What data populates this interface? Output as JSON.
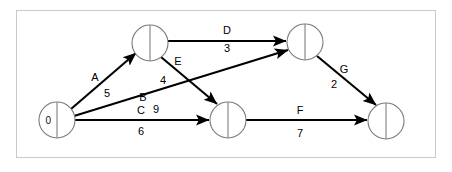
{
  "figure": {
    "type": "activity-on-arrow-network",
    "frame": {
      "x": 16,
      "y": 10,
      "width": 420,
      "height": 148,
      "border_color": "#c9c9c9"
    },
    "background_color": "#ffffff",
    "line_color": "#000000",
    "node_stroke_color": "#7a7a7a"
  },
  "nodes": [
    {
      "id": "start",
      "label": "0",
      "cx": 57,
      "cy": 120,
      "r": 18
    },
    {
      "id": "n-top-left",
      "label": "",
      "cx": 150,
      "cy": 43,
      "r": 18
    },
    {
      "id": "n-top-right",
      "label": "",
      "cx": 305,
      "cy": 42,
      "r": 18
    },
    {
      "id": "n-middle",
      "label": "",
      "cx": 228,
      "cy": 120,
      "r": 18
    },
    {
      "id": "n-bottom-right",
      "label": "",
      "cx": 386,
      "cy": 121,
      "r": 18
    }
  ],
  "edges": [
    {
      "id": "A",
      "label": "A",
      "duration": "5",
      "from": "start",
      "to": "n-top-left",
      "x1": 71,
      "y1": 109,
      "x2": 136,
      "y2": 53,
      "label_x": 95,
      "label_y": 77,
      "duration_x": 107,
      "duration_y": 93
    },
    {
      "id": "B",
      "label": "B",
      "duration": "9",
      "from": "start",
      "to": "n-top-right",
      "x1": 74,
      "y1": 116,
      "x2": 288,
      "y2": 50,
      "label_x": 143,
      "label_y": 97,
      "duration_x": 156,
      "duration_y": 109
    },
    {
      "id": "C",
      "label": "C",
      "duration": "6",
      "from": "start",
      "to": "n-middle",
      "x1": 75,
      "y1": 120,
      "x2": 209,
      "y2": 120,
      "label_x": 141,
      "label_y": 110,
      "duration_x": 141,
      "duration_y": 131
    },
    {
      "id": "D",
      "label": "D",
      "duration": "3",
      "from": "n-top-left",
      "to": "n-top-right",
      "x1": 168,
      "y1": 41,
      "x2": 286,
      "y2": 41,
      "label_x": 227,
      "label_y": 30,
      "duration_x": 227,
      "duration_y": 48
    },
    {
      "id": "E",
      "label": "E",
      "duration": "4",
      "from": "n-top-left",
      "to": "n-middle",
      "x1": 161,
      "y1": 57,
      "x2": 217,
      "y2": 104,
      "label_x": 178,
      "label_y": 61,
      "duration_x": 163,
      "duration_y": 80
    },
    {
      "id": "F",
      "label": "F",
      "duration": "7",
      "from": "n-middle",
      "to": "n-bottom-right",
      "x1": 246,
      "y1": 120,
      "x2": 367,
      "y2": 120,
      "label_x": 300,
      "label_y": 110,
      "duration_x": 300,
      "duration_y": 133
    },
    {
      "id": "G",
      "label": "G",
      "duration": "2",
      "from": "n-top-right",
      "to": "n-bottom-right",
      "x1": 317,
      "y1": 56,
      "x2": 376,
      "y2": 105,
      "label_x": 344,
      "label_y": 69,
      "duration_x": 334,
      "duration_y": 84
    }
  ]
}
